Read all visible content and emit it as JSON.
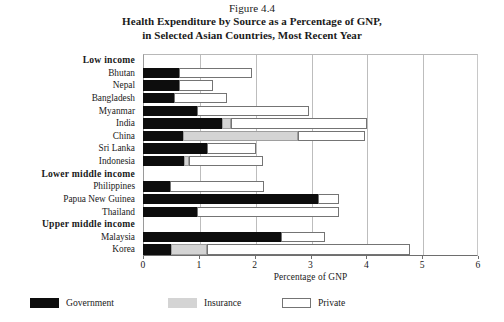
{
  "figure": {
    "number": "Figure 4.4",
    "title_line1": "Health Expenditure by Source as a Percentage of GNP,",
    "title_line2": "in Selected Asian Countries, Most Recent Year"
  },
  "axis": {
    "x_title": "Percentage of GNP",
    "x_ticks": [
      "0",
      "1",
      "2",
      "3",
      "4",
      "5",
      "6"
    ]
  },
  "legend": {
    "items": [
      {
        "label": "Government",
        "swatch": "black-filled-swatch",
        "color": "#0d0d0d"
      },
      {
        "label": "Insurance",
        "swatch": "gray-filled-swatch",
        "color": "#d4d4d4"
      },
      {
        "label": "Private",
        "swatch": "white-outlined-swatch",
        "color": "#ffffff"
      }
    ]
  },
  "chart_data": {
    "type": "bar",
    "orientation": "horizontal",
    "stacked": true,
    "title": "Health Expenditure by Source as a Percentage of GNP, in Selected Asian Countries, Most Recent Year",
    "xlabel": "Percentage of GNP",
    "ylabel": "",
    "xlim": [
      0,
      6
    ],
    "xticks": [
      0,
      1,
      2,
      3,
      4,
      5,
      6
    ],
    "grid": true,
    "grid_axis": "x",
    "legend": [
      "Government",
      "Insurance",
      "Private"
    ],
    "legend_position": "below-bottom-left",
    "series": [
      {
        "name": "Government",
        "color": "#0d0d0d"
      },
      {
        "name": "Insurance",
        "color": "#d4d4d4"
      },
      {
        "name": "Private",
        "color": "#ffffff"
      }
    ],
    "groups": [
      {
        "group_label": "Low income",
        "rows": [
          {
            "category": "Bhutan",
            "Government": 0.64,
            "Insurance": 0.0,
            "Private": 1.31,
            "total": 1.95
          },
          {
            "category": "Nepal",
            "Government": 0.65,
            "Insurance": 0.0,
            "Private": 0.6,
            "total": 1.25
          },
          {
            "category": "Bangladesh",
            "Government": 0.55,
            "Insurance": 0.0,
            "Private": 0.95,
            "total": 1.5
          },
          {
            "category": "Myanmar",
            "Government": 0.96,
            "Insurance": 0.0,
            "Private": 2.01,
            "total": 2.97
          },
          {
            "category": "India",
            "Government": 1.41,
            "Insurance": 0.17,
            "Private": 2.44,
            "total": 4.02
          },
          {
            "category": "China",
            "Government": 0.71,
            "Insurance": 2.06,
            "Private": 1.21,
            "total": 3.98
          },
          {
            "category": "Sri Lanka",
            "Government": 1.14,
            "Insurance": 0.0,
            "Private": 0.89,
            "total": 2.03
          },
          {
            "category": "Indonesia",
            "Government": 0.74,
            "Insurance": 0.09,
            "Private": 1.32,
            "total": 2.15
          }
        ]
      },
      {
        "group_label": "Lower middle income",
        "rows": [
          {
            "category": "Philippines",
            "Government": 0.49,
            "Insurance": 0.0,
            "Private": 1.68,
            "total": 2.17
          },
          {
            "category": "Papua New Guinea",
            "Government": 3.14,
            "Insurance": 0.0,
            "Private": 0.37,
            "total": 3.51
          },
          {
            "category": "Thailand",
            "Government": 0.96,
            "Insurance": 0.0,
            "Private": 2.55,
            "total": 3.51
          }
        ]
      },
      {
        "group_label": "Upper middle income",
        "rows": [
          {
            "category": "Malaysia",
            "Government": 2.47,
            "Insurance": 0.0,
            "Private": 0.79,
            "total": 3.26
          },
          {
            "category": "Korea",
            "Government": 0.51,
            "Insurance": 0.63,
            "Private": 3.65,
            "total": 4.79
          }
        ]
      }
    ]
  }
}
